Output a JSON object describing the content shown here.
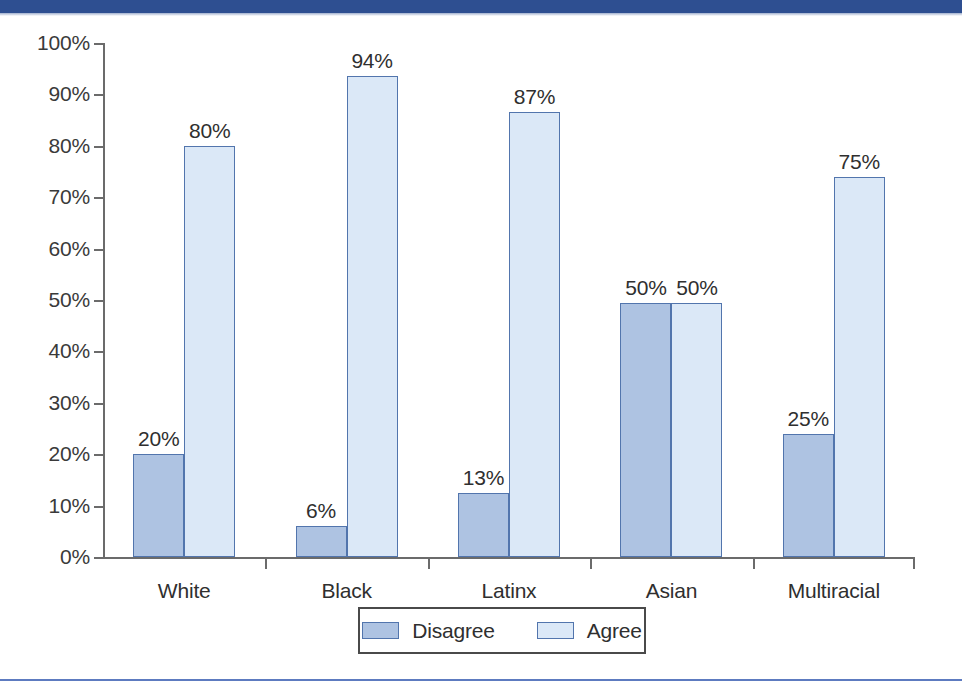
{
  "banner": {
    "color": "#2e4f91"
  },
  "bottom_rule": {
    "color": "#5d7bc0"
  },
  "legend": {
    "entries": [
      {
        "label": "Disagree",
        "color": "#aec3e2",
        "key": "disagree"
      },
      {
        "label": "Agree",
        "color": "#dbe8f7",
        "key": "agree"
      }
    ]
  },
  "chart_data": {
    "type": "bar",
    "title": "",
    "xlabel": "",
    "ylabel": "",
    "ylim": [
      0,
      100
    ],
    "grid": false,
    "legend_position": "bottom-center",
    "value_suffix": "%",
    "categories": [
      "White",
      "Black",
      "Latinx",
      "Asian",
      "Multiracial"
    ],
    "ytick_labels": [
      "0%",
      "10%",
      "20%",
      "30%",
      "40%",
      "50%",
      "60%",
      "70%",
      "80%",
      "90%",
      "100%"
    ],
    "ytick_values": [
      0,
      10,
      20,
      30,
      40,
      50,
      60,
      70,
      80,
      90,
      100
    ],
    "series": [
      {
        "name": "Disagree",
        "color": "#aec3e2",
        "values": [
          20,
          6,
          13,
          50,
          25
        ],
        "labels": [
          "20%",
          "6%",
          "13%",
          "50%",
          "25%"
        ],
        "drawn_values": [
          20,
          6,
          12.5,
          49.5,
          24
        ]
      },
      {
        "name": "Agree",
        "color": "#dbe8f7",
        "values": [
          80,
          94,
          87,
          50,
          75
        ],
        "labels": [
          "80%",
          "94%",
          "87%",
          "50%",
          "75%"
        ],
        "drawn_values": [
          80,
          93.5,
          86.5,
          49.5,
          74
        ]
      }
    ]
  }
}
